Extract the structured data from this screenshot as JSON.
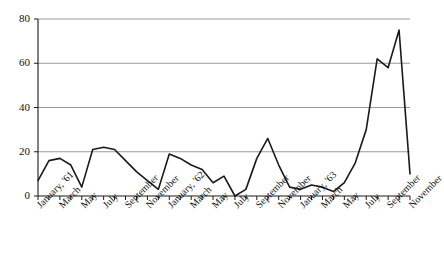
{
  "chart_data": {
    "type": "line",
    "title": "",
    "subtitle": "",
    "xlabel": "",
    "ylabel": "",
    "ylim": [
      0,
      80
    ],
    "yticks": [
      0,
      20,
      40,
      60,
      80
    ],
    "ytick_labels": [
      "0",
      "20",
      "40",
      "60",
      "80"
    ],
    "grid": "horizontal",
    "legend": "none",
    "x": [
      "January, '61",
      "February, '61",
      "March, '61",
      "April, '61",
      "May, '61",
      "June, '61",
      "July, '61",
      "August, '61",
      "September, '61",
      "October, '61",
      "November, '61",
      "December, '61",
      "January, '62",
      "February, '62",
      "March, '62",
      "April, '62",
      "May, '62",
      "June, '62",
      "July, '62",
      "August, '62",
      "September, '62",
      "October, '62",
      "November, '62",
      "December, '62",
      "January, '63",
      "February, '63",
      "March, '63",
      "April, '63",
      "May, '63",
      "June, '63",
      "July, '63",
      "August, '63",
      "September, '63",
      "October, '63",
      "November, '63"
    ],
    "xtick_labels": [
      "January, '61",
      "March",
      "May",
      "July",
      "September",
      "November",
      "January, '62",
      "March",
      "May",
      "July",
      "September",
      "November",
      "January, '63",
      "March",
      "May",
      "July",
      "September",
      "November"
    ],
    "xtick_indices": [
      0,
      2,
      4,
      6,
      8,
      10,
      12,
      14,
      16,
      18,
      20,
      22,
      24,
      26,
      28,
      30,
      32,
      34
    ],
    "values": [
      7,
      16,
      17,
      14,
      4,
      21,
      22,
      21,
      16,
      11,
      7,
      3,
      19,
      17,
      14,
      12,
      6,
      9,
      0,
      3,
      17,
      26,
      14,
      4,
      3,
      5,
      4,
      2,
      6,
      15,
      30,
      62,
      58,
      75,
      10
    ],
    "series": [
      {
        "name": "series-1",
        "color": "#1a1a1a",
        "values": [
          7,
          16,
          17,
          14,
          4,
          21,
          22,
          21,
          16,
          11,
          7,
          3,
          19,
          17,
          14,
          12,
          6,
          9,
          0,
          3,
          17,
          26,
          14,
          4,
          3,
          5,
          4,
          2,
          6,
          15,
          30,
          62,
          58,
          75,
          10
        ]
      }
    ],
    "colors": {
      "line": "#1a1a1a",
      "grid": "#9a9a9a",
      "axis": "#1a1a1a",
      "background": "#ffffff"
    }
  }
}
